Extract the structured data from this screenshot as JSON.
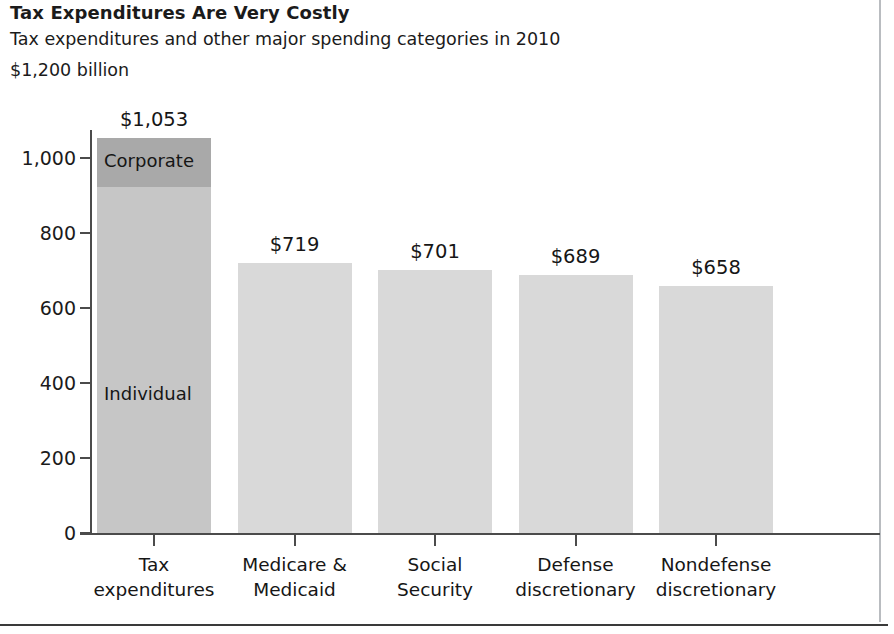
{
  "header": {
    "title": "Tax Expenditures Are Very Costly",
    "subtitle": "Tax expenditures and other major spending categories in 2010",
    "unit": "$1,200 billion"
  },
  "colors": {
    "corporate_segment": "#a9a9a9",
    "individual_segment": "#c6c6c6",
    "other_bars": "#d9d9d9",
    "axis": "#4b4b4b",
    "text": "#1b1b1b",
    "frame_right": "#b9bcc0",
    "frame_bottom": "#3a3a3a"
  },
  "chart_data": {
    "type": "bar",
    "title": "Tax Expenditures Are Very Costly",
    "subtitle": "Tax expenditures and other major spending categories in 2010",
    "xlabel": "",
    "ylabel": "$1,200 billion",
    "ylim": [
      0,
      1080
    ],
    "grid": false,
    "legend_position": "in-bar",
    "yticks": [
      0,
      200,
      400,
      600,
      800,
      1000
    ],
    "ytick_labels": [
      "0",
      "200",
      "400",
      "600",
      "800",
      "1,000"
    ],
    "categories": [
      "Tax expenditures",
      "Medicare & Medicaid",
      "Social Security",
      "Defense discretionary",
      "Nondefense discretionary"
    ],
    "category_lines": [
      [
        "Tax",
        "expenditures"
      ],
      [
        "Medicare &",
        "Medicaid"
      ],
      [
        "Social",
        "Security"
      ],
      [
        "Defense",
        "discretionary"
      ],
      [
        "Nondefense",
        "discretionary"
      ]
    ],
    "values": [
      1053,
      719,
      701,
      689,
      658
    ],
    "value_labels": [
      "$1,053",
      "$719",
      "$701",
      "$689",
      "$658"
    ],
    "stacked_first_bar": {
      "segments": [
        {
          "name": "Individual",
          "value": 1053,
          "label": "Individual",
          "color": "#c6c6c6"
        },
        {
          "name": "Corporate",
          "value": 1053,
          "label": "Corporate",
          "color": "#a9a9a9"
        }
      ],
      "note": "First bar is split into an upper 'Corporate' band and a lower 'Individual' band"
    }
  }
}
